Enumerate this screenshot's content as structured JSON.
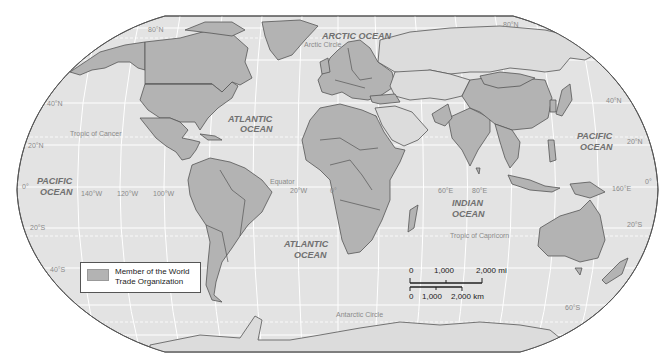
{
  "map": {
    "title": "World Trade Organization Members",
    "colors": {
      "ocean": "#e3e3e3",
      "member_land": "#b3b3b3",
      "nonmember_land": "#dcdcdc",
      "border": "#555555",
      "graticule": "#ffffff",
      "frame": "#555555"
    },
    "oceans": [
      {
        "id": "arctic",
        "line1": "ARCTIC OCEAN",
        "line2": ""
      },
      {
        "id": "atlantic-north",
        "line1": "ATLANTIC",
        "line2": "OCEAN"
      },
      {
        "id": "atlantic-south",
        "line1": "ATLANTIC",
        "line2": "OCEAN"
      },
      {
        "id": "pacific-west",
        "line1": "PACIFIC",
        "line2": "OCEAN"
      },
      {
        "id": "pacific-east",
        "line1": "PACIFIC",
        "line2": "OCEAN"
      },
      {
        "id": "indian",
        "line1": "INDIAN",
        "line2": "OCEAN"
      }
    ],
    "special_lines": {
      "arctic_circle": "Arctic Circle",
      "tropic_cancer": "Tropic of Cancer",
      "equator": "Equator",
      "tropic_capricorn": "Tropic of Capricorn",
      "antarctic_circle": "Antarctic Circle"
    },
    "latitude_labels": {
      "n80_left": "80°N",
      "n80_right": "80°N",
      "n40_left": "40°N",
      "n40_right": "40°N",
      "n20_left": "20°N",
      "n20_right": "20°N",
      "eq_left": "0°",
      "eq_right": "0°",
      "s20_left": "20°S",
      "s20_right": "20°S",
      "s40_left": "40°S",
      "s60_right": "60°S"
    },
    "longitude_labels": {
      "w140": "140°W",
      "w120": "120°W",
      "w100": "100°W",
      "w20": "20°W",
      "zero": "0°",
      "e60": "60°E",
      "e80": "80°E",
      "e160": "160°E"
    },
    "legend": {
      "line1": "Member of  the World",
      "line2": "Trade Organization"
    },
    "scale_bar": {
      "mi_0": "0",
      "mi_1000": "1,000",
      "mi_2000": "2,000 mi",
      "km_0": "0",
      "km_1000": "1,000",
      "km_2000": "2,000 km"
    }
  }
}
